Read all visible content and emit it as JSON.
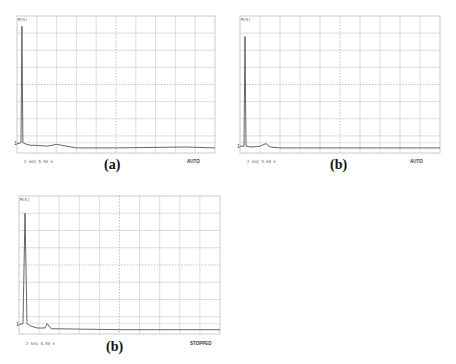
{
  "figure": {
    "panels": [
      {
        "id": "a",
        "caption": "(a)",
        "trace_label": "M(S)",
        "footer": "2 kHz 5.50 k",
        "status": "AUTO",
        "box": {
          "x": 17,
          "y": 16,
          "w": 198,
          "h": 137
        }
      },
      {
        "id": "b",
        "caption": "(b)",
        "trace_label": "M(S)",
        "footer": "2 kHz 5.60 k",
        "status": "AUTO",
        "box": {
          "x": 240,
          "y": 16,
          "w": 200,
          "h": 137
        }
      },
      {
        "id": "c",
        "caption": "(b)",
        "trace_label": "M(S)",
        "footer": "2 kHz 8.50 k",
        "status": "STOPPED",
        "box": {
          "x": 19,
          "y": 196,
          "w": 201,
          "h": 138
        }
      }
    ],
    "colors": {
      "grid": "#c8c8c8",
      "grid_center": "#9a9a9a",
      "trace": "#555555",
      "frame": "#bdbdbd"
    }
  },
  "chart_data": [
    {
      "type": "line",
      "title": "(a)",
      "xlabel": "",
      "ylabel": "",
      "grid": true,
      "divisions": {
        "x": 10,
        "y": 8
      },
      "x": [
        0,
        0.2,
        0.25,
        0.3,
        0.5,
        0.7,
        1.0,
        1.5,
        2.0,
        3.0,
        5.0,
        8.5,
        10
      ],
      "values": [
        0.55,
        0.6,
        7.4,
        0.6,
        0.5,
        0.45,
        0.45,
        0.4,
        0.5,
        0.3,
        0.3,
        0.35,
        0.3
      ],
      "annotations": [
        "M(S)",
        "2 kHz 5.50 k",
        "AUTO"
      ],
      "ylim": [
        0,
        8
      ],
      "xlim": [
        0,
        10
      ]
    },
    {
      "type": "line",
      "title": "(b)",
      "xlabel": "",
      "ylabel": "",
      "grid": true,
      "divisions": {
        "x": 10,
        "y": 8
      },
      "x": [
        0,
        0.2,
        0.25,
        0.3,
        0.6,
        1.0,
        1.3,
        1.5,
        2.0,
        3.0,
        5.0,
        10
      ],
      "values": [
        0.4,
        0.4,
        6.8,
        0.4,
        0.35,
        0.4,
        0.55,
        0.35,
        0.3,
        0.3,
        0.3,
        0.3
      ],
      "annotations": [
        "M(S)",
        "2 kHz 5.60 k",
        "AUTO"
      ],
      "ylim": [
        0,
        8
      ],
      "xlim": [
        0,
        10
      ]
    },
    {
      "type": "line",
      "title": "(b)",
      "xlabel": "",
      "ylabel": "",
      "grid": true,
      "divisions": {
        "x": 10,
        "y": 8
      },
      "x": [
        0,
        0.2,
        0.3,
        0.4,
        0.6,
        0.9,
        1.3,
        1.4,
        1.6,
        2.0,
        5.0,
        10
      ],
      "values": [
        0.55,
        0.6,
        7.0,
        0.6,
        0.45,
        0.35,
        0.35,
        0.6,
        0.3,
        0.3,
        0.25,
        0.25
      ],
      "annotations": [
        "M(S)",
        "2 kHz 8.50 k",
        "STOPPED"
      ],
      "ylim": [
        0,
        8
      ],
      "xlim": [
        0,
        10
      ]
    }
  ]
}
